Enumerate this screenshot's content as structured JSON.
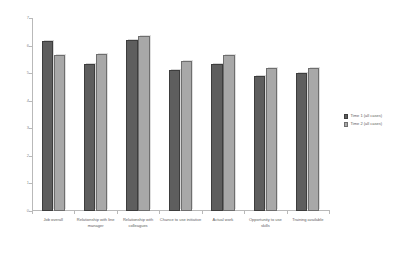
{
  "chart_data": {
    "type": "bar",
    "title": "",
    "subtitle": "",
    "xlabel": "",
    "ylabel": "",
    "ylim": [
      0,
      7
    ],
    "ytick_step": 1,
    "yticks": [
      "0",
      "1",
      "2",
      "3",
      "4",
      "5",
      "6",
      "7"
    ],
    "grid": false,
    "legend_position": "right",
    "categories": [
      "Job overall",
      "Relationship with line manager",
      "Relationship with colleagues",
      "Chance to use initiative",
      "Actual work",
      "Opportunity to use skills",
      "Training available"
    ],
    "series": [
      {
        "name": "Time 1 (all cases)",
        "color": "#5e5e5e",
        "values": [
          6.15,
          5.35,
          6.2,
          5.1,
          5.35,
          4.9,
          5.0
        ]
      },
      {
        "name": "Time 2 (all cases)",
        "color": "#a8a8a8",
        "values": [
          5.65,
          5.7,
          6.35,
          5.45,
          5.65,
          5.2,
          5.2
        ]
      }
    ]
  },
  "legend": {
    "items": [
      {
        "label": "Time 1 (all cases)",
        "swatch": "s1"
      },
      {
        "label": "Time 2 (all cases)",
        "swatch": "s2"
      }
    ]
  },
  "colors": {
    "series_1": "#5e5e5e",
    "series_2": "#a8a8a8",
    "axis": "#b9b9b9",
    "text": "#5d5d5d",
    "background": "#ffffff"
  }
}
